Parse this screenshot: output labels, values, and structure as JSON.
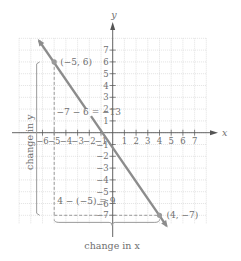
{
  "chart_data": {
    "type": "line",
    "title": "",
    "xlabel": "x",
    "ylabel": "y",
    "xlim": [
      -8,
      8
    ],
    "ylim": [
      -8,
      8
    ],
    "grid": true,
    "x_ticks": [
      -6,
      -5,
      -4,
      -3,
      -2,
      -1,
      1,
      2,
      3,
      4,
      5,
      6,
      7
    ],
    "x_tick_labels": [
      "−6",
      "−5",
      "−4",
      "−3",
      "−2",
      "−1",
      "1",
      "2",
      "3",
      "4",
      "5",
      "6",
      "7"
    ],
    "y_ticks": [
      7,
      6,
      5,
      4,
      3,
      2,
      1,
      -1,
      -2,
      -3,
      -4,
      -5,
      -6,
      -7
    ],
    "y_tick_labels": [
      "7",
      "6",
      "5",
      "4",
      "3",
      "2",
      "1",
      "−1",
      "−2",
      "−3",
      "−4",
      "−5",
      "−6",
      "−7"
    ],
    "series": [
      {
        "name": "line",
        "x": [
          -6.3,
          4.6
        ],
        "y": [
          7.8,
          -7.9
        ],
        "slope": "-13/9",
        "color": "#8c8c8c"
      }
    ],
    "points": [
      {
        "x": -5,
        "y": 6,
        "label": "(−5, 6)"
      },
      {
        "x": 4,
        "y": -7,
        "label": "(4, −7)"
      }
    ],
    "annotations": {
      "rise_equation": "−7 − 6 = −13",
      "run_equation": "4 − (−5) = 9",
      "vertical_brace_label": "change in y",
      "horizontal_brace_label": "change in x"
    },
    "colors": {
      "line": "#8c8c8c",
      "axis": "#555555",
      "grid": "#cfcfcf",
      "dashed": "#9a9a9a",
      "text": "#6f6f6f"
    }
  }
}
